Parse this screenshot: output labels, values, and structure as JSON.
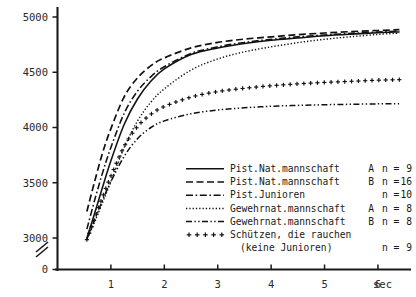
{
  "chart_data": {
    "type": "line",
    "title": "",
    "subtitle": "",
    "xlabel": "sec",
    "ylabel": "",
    "xlim": [
      0,
      6.6
    ],
    "ylim": [
      2900,
      5050
    ],
    "grid": false,
    "y_axis_break": true,
    "y_break_between": [
      0,
      3000
    ],
    "legend_position": "bottom-right",
    "x_ticks": [
      1,
      2,
      3,
      4,
      5,
      6
    ],
    "x_tick_labels": [
      "1",
      "2",
      "3",
      "4",
      "5",
      "6"
    ],
    "y_ticks": [
      0,
      3000,
      3500,
      4000,
      4500,
      5000
    ],
    "y_tick_labels": [
      "0",
      "3000",
      "3500",
      "4000",
      "4500",
      "5000"
    ],
    "x": [
      0.55,
      0.7,
      0.85,
      1.0,
      1.25,
      1.5,
      1.75,
      2.0,
      2.5,
      3.0,
      3.5,
      4.0,
      4.5,
      5.0,
      5.5,
      6.0,
      6.4
    ],
    "series": [
      {
        "name": "Pist.Nat.mannschaft  A",
        "n": 9,
        "style": "solid",
        "values": [
          3000,
          3230,
          3470,
          3700,
          4030,
          4260,
          4420,
          4530,
          4660,
          4720,
          4760,
          4790,
          4810,
          4830,
          4845,
          4858,
          4865
        ]
      },
      {
        "name": "Pist.Nat.mannschaft  B",
        "n": 16,
        "style": "dashed",
        "values": [
          3240,
          3520,
          3780,
          3990,
          4280,
          4450,
          4560,
          4630,
          4720,
          4770,
          4800,
          4820,
          4840,
          4855,
          4868,
          4878,
          4885
        ]
      },
      {
        "name": "Pist.Junioren",
        "n": 10,
        "style": "dash-dot",
        "values": [
          3080,
          3350,
          3600,
          3820,
          4130,
          4330,
          4460,
          4550,
          4670,
          4730,
          4770,
          4798,
          4820,
          4838,
          4852,
          4865,
          4872
        ]
      },
      {
        "name": "Gewehrnat.mannschaft A",
        "n": 8,
        "style": "dotted",
        "values": [
          2990,
          3150,
          3330,
          3510,
          3820,
          4060,
          4230,
          4350,
          4520,
          4620,
          4685,
          4730,
          4768,
          4798,
          4822,
          4842,
          4855
        ]
      },
      {
        "name": "Gewehrnat.mannschaft B",
        "n": 8,
        "style": "dash-dot-dot",
        "values": [
          2990,
          3170,
          3350,
          3510,
          3740,
          3900,
          4000,
          4060,
          4125,
          4158,
          4178,
          4192,
          4200,
          4206,
          4210,
          4214,
          4216
        ]
      },
      {
        "name": "Schützen, die rauchen",
        "name_line2": "(keine Junioren)",
        "n": 9,
        "style": "plus-markers",
        "values": [
          2985,
          3180,
          3380,
          3560,
          3830,
          4010,
          4120,
          4190,
          4275,
          4325,
          4355,
          4378,
          4395,
          4408,
          4418,
          4428,
          4433
        ]
      }
    ],
    "legend": {
      "n_prefix": "n =",
      "entries": [
        {
          "label": "Pist.Nat.mannschaft",
          "variant": "A",
          "n": "9",
          "style": "solid"
        },
        {
          "label": "Pist.Nat.mannschaft",
          "variant": "B",
          "n": "16",
          "style": "dashed"
        },
        {
          "label": "Pist.Junioren",
          "variant": "",
          "n": "10",
          "style": "dash-dot"
        },
        {
          "label": "Gewehrnat.mannschaft",
          "variant": "A",
          "n": "8",
          "style": "dotted"
        },
        {
          "label": "Gewehrnat.mannschaft",
          "variant": "B",
          "n": "8",
          "style": "dash-dot-dot"
        },
        {
          "label": "Schützen, die rauchen",
          "variant": "",
          "n": "9",
          "style": "plus-markers",
          "label_line2": "(keine Junioren)"
        }
      ]
    },
    "colors": {
      "ink": "#111111",
      "axis": "#1a1a1a",
      "background": "#ffffff"
    }
  }
}
